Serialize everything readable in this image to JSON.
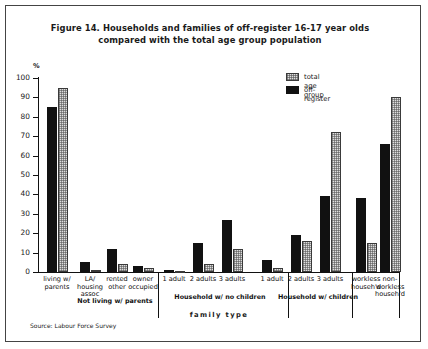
{
  "figure": {
    "title_line1": "Figure 14. Households and families of off-register 16-17 year olds",
    "title_line2": "compared with the total age group population",
    "source": "Source: Labour Force Survey"
  },
  "legend": {
    "items": [
      {
        "label": "total age group",
        "swatch": "hatched-gray",
        "color": "#dedede"
      },
      {
        "label": "off-register",
        "swatch": "solid-black",
        "color": "#111111"
      }
    ]
  },
  "chart_data": {
    "type": "bar",
    "title": "Figure 14. Households and families of off-register 16-17 year olds compared with the total age group population",
    "xlabel": "family type",
    "ylabel": "%",
    "ylim": [
      0,
      100
    ],
    "yticks": [
      0,
      10,
      20,
      30,
      40,
      50,
      60,
      70,
      80,
      90,
      100
    ],
    "grid": false,
    "legend_position": "top-right",
    "categories": [
      "living w/ parents",
      "LA/ housing assoc",
      "rented other",
      "owner occupied",
      "1 adult",
      "2 adults",
      "3 adults",
      "1 adult",
      "2 adults",
      "3 adults",
      "workless househ'd",
      "non-workless househ'd"
    ],
    "series": [
      {
        "name": "off-register",
        "color": "#111111",
        "values": [
          85,
          5,
          12,
          3,
          1,
          15,
          27,
          6,
          19,
          39,
          38,
          66
        ]
      },
      {
        "name": "total age group",
        "color": "#dedede",
        "values": [
          95,
          1,
          4,
          2,
          0.5,
          4,
          12,
          2,
          16,
          72,
          15,
          90
        ]
      }
    ],
    "groups": [
      {
        "label": "Not living w/ parents",
        "categories": [
          1,
          2,
          3
        ]
      },
      {
        "label": "Household w/ no children",
        "categories": [
          4,
          5,
          6
        ]
      },
      {
        "label": "Household w/ children",
        "categories": [
          7,
          8,
          9
        ]
      }
    ]
  }
}
